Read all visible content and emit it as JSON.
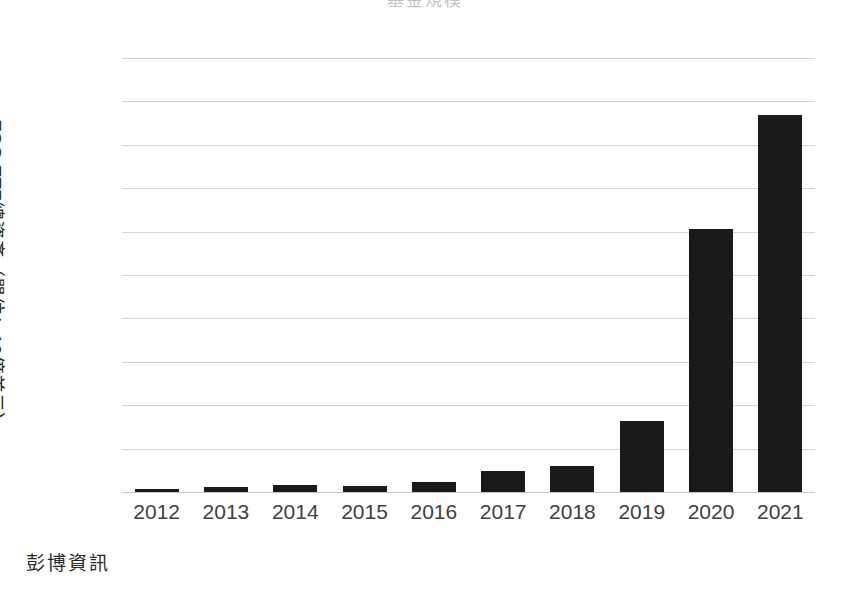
{
  "chart_data": {
    "type": "bar",
    "title": "",
    "xlabel": "",
    "ylabel": "ESG ETF總資產（單位：10億美元）",
    "ylim": [
      0,
      100
    ],
    "ytick_values": [
      0,
      10,
      20,
      30,
      40,
      50,
      60,
      70,
      80,
      90,
      100
    ],
    "ytick_labels": [
      "0",
      "10",
      "20",
      "30",
      "40",
      "50",
      "60",
      "70",
      "80",
      "90",
      "100"
    ],
    "grid": true,
    "legend": null,
    "bar_color": "#1a1a1a",
    "categories": [
      "2012",
      "2013",
      "2014",
      "2015",
      "2016",
      "2017",
      "2018",
      "2019",
      "2020",
      "2021"
    ],
    "values": [
      0.7,
      1.2,
      1.6,
      1.4,
      2.4,
      4.8,
      6.0,
      16.3,
      60.5,
      86.8
    ],
    "source": "彭博資訊"
  },
  "figure": {
    "title_text": "基金規模",
    "source_label": "彭博資訊"
  }
}
